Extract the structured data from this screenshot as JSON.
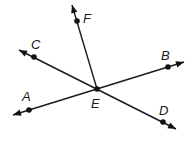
{
  "diagram": {
    "type": "geometry-lines",
    "center": {
      "label": "E",
      "x": 97,
      "y": 89,
      "label_x": 91,
      "label_y": 108
    },
    "lines": [
      {
        "name": "line-AB",
        "end1": {
          "label": "A",
          "point": [
            29,
            110
          ],
          "tip": [
            13,
            115
          ],
          "label_pos": [
            22,
            101
          ]
        },
        "end2": {
          "label": "B",
          "point": [
            168,
            67
          ],
          "tip": [
            184,
            62
          ],
          "label_pos": [
            161,
            60
          ]
        }
      },
      {
        "name": "line-CD",
        "end1": {
          "label": "C",
          "point": [
            34,
            57
          ],
          "tip": [
            19,
            50
          ],
          "label_pos": [
            31,
            49
          ]
        },
        "end2": {
          "label": "D",
          "point": [
            163,
            122
          ],
          "tip": [
            176,
            129
          ],
          "label_pos": [
            159,
            115
          ]
        }
      }
    ],
    "rays": [
      {
        "name": "ray-EF",
        "end": {
          "label": "F",
          "point": [
            77,
            21
          ],
          "tip": [
            72,
            5
          ],
          "label_pos": [
            83,
            23
          ]
        }
      }
    ],
    "labels": [
      "A",
      "B",
      "C",
      "D",
      "E",
      "F"
    ],
    "colors": {
      "stroke": "#1a1a1a",
      "background": "#ffffff"
    }
  }
}
